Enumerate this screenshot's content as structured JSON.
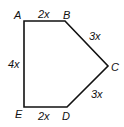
{
  "diagram": {
    "type": "pentagon",
    "vertices": [
      {
        "name": "A",
        "x": 24,
        "y": 21
      },
      {
        "name": "B",
        "x": 65,
        "y": 21
      },
      {
        "name": "C",
        "x": 108,
        "y": 66
      },
      {
        "name": "D",
        "x": 67,
        "y": 107
      },
      {
        "name": "E",
        "x": 24,
        "y": 107
      }
    ],
    "vertex_labels": {
      "A": "A",
      "B": "B",
      "C": "C",
      "D": "D",
      "E": "E"
    },
    "sides": [
      {
        "from": "A",
        "to": "B",
        "label": "2x"
      },
      {
        "from": "B",
        "to": "C",
        "label": "3x"
      },
      {
        "from": "C",
        "to": "D",
        "label": "3x"
      },
      {
        "from": "D",
        "to": "E",
        "label": "2x"
      },
      {
        "from": "E",
        "to": "A",
        "label": "4x"
      }
    ],
    "stroke_color": "#111111"
  }
}
